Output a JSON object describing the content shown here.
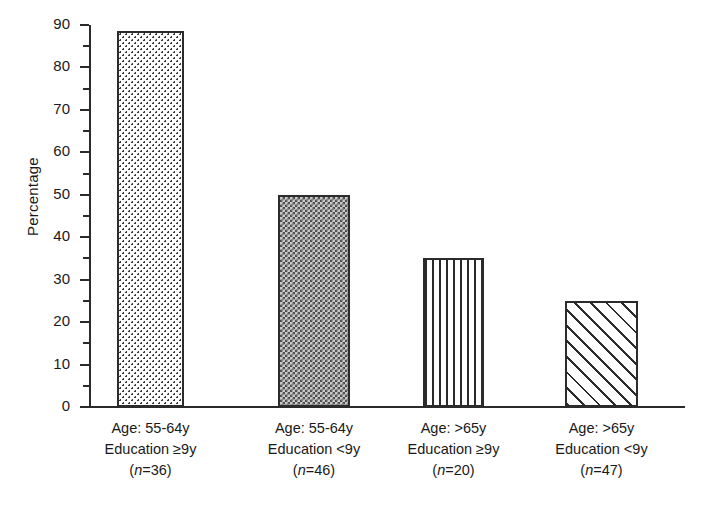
{
  "chart_data": {
    "type": "bar",
    "title": "",
    "xlabel": "",
    "ylabel": "Percentage",
    "ylim": [
      0,
      90
    ],
    "ytick_step": 10,
    "yminor_step": 5,
    "grid": false,
    "legend": "none",
    "categories": [
      "Age: 55-64y Education ≥9y (n=36)",
      "Age: 55-64y Education <9y (n=46)",
      "Age: >65y Education ≥9y (n=20)",
      "Age: >65y Education <9y (n=47)"
    ],
    "values": [
      88.5,
      50,
      35,
      25
    ],
    "ytick_labels": [
      "0",
      "10",
      "20",
      "30",
      "40",
      "50",
      "60",
      "70",
      "80",
      "90"
    ],
    "bar_fills": [
      "dots",
      "checker",
      "vertical-lines",
      "diagonal-hatch"
    ]
  },
  "axis": {
    "y_title": "Percentage",
    "ticks": [
      {
        "value": 90,
        "label": "90"
      },
      {
        "value": 80,
        "label": "80"
      },
      {
        "value": 70,
        "label": "70"
      },
      {
        "value": 60,
        "label": "60"
      },
      {
        "value": 50,
        "label": "50"
      },
      {
        "value": 40,
        "label": "40"
      },
      {
        "value": 30,
        "label": "30"
      },
      {
        "value": 20,
        "label": "20"
      },
      {
        "value": 10,
        "label": "10"
      },
      {
        "value": 0,
        "label": "0"
      }
    ]
  },
  "bars": [
    {
      "value": 88.5,
      "fill": "dots",
      "line1": "Age: 55-64y",
      "line2": "Education ≥9y",
      "line3_pre": "(",
      "line3_n": "n",
      "line3_post": "=36)"
    },
    {
      "value": 50,
      "fill": "checker",
      "line1": "Age: 55-64y",
      "line2": "Education <9y",
      "line3_pre": "(",
      "line3_n": "n",
      "line3_post": "=46)"
    },
    {
      "value": 35,
      "fill": "vertical-lines",
      "line1": "Age: >65y",
      "line2": "Education ≥9y",
      "line3_pre": "(",
      "line3_n": "n",
      "line3_post": "=20)"
    },
    {
      "value": 25,
      "fill": "diagonal-hatch",
      "line1": "Age: >65y",
      "line2": "Education <9y",
      "line3_pre": "(",
      "line3_n": "n",
      "line3_post": "=47)"
    }
  ],
  "colors": {
    "ink": "#2b2b2b",
    "background": "#ffffff"
  }
}
